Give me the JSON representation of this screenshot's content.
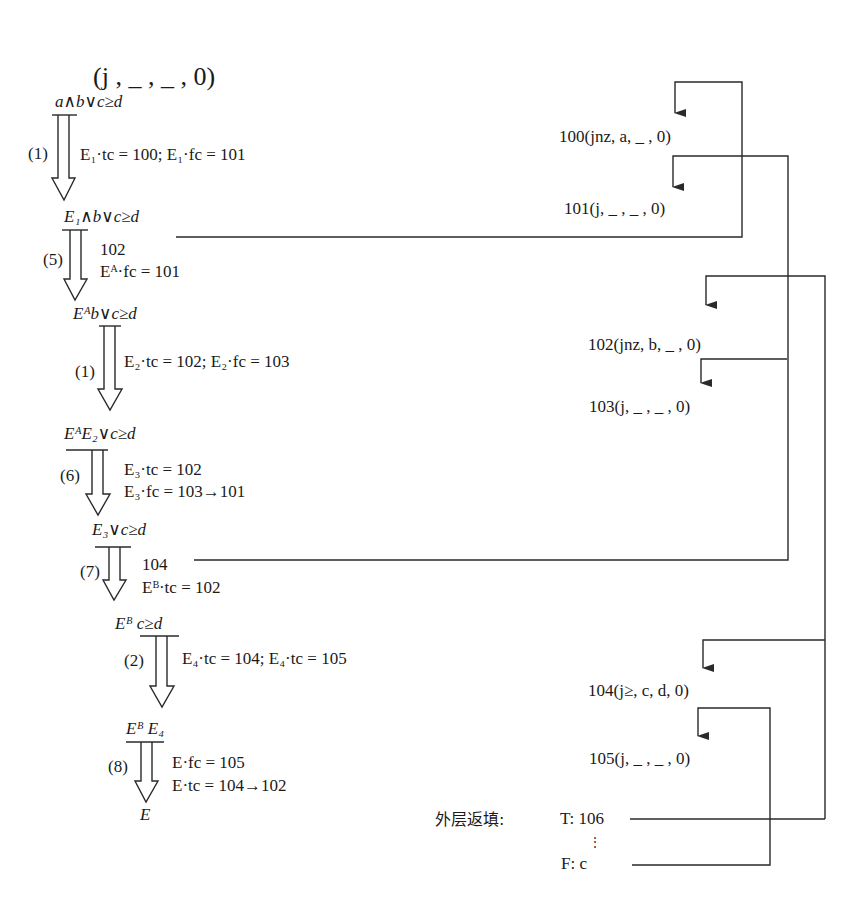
{
  "header": {
    "title": "(j , _ , _ , 0)"
  },
  "derivation": {
    "expressions": [
      "a∧b∨c≥d",
      "E₁∧b∨c≥d",
      "Eᴬb∨c≥d",
      "EᴬE₂∨c≥d",
      "E₃∨c≥d",
      "Eᴮ c≥d",
      "Eᴮ E₄",
      "E"
    ],
    "steps": [
      {
        "rule": "(1)",
        "lines": [
          "E₁·tc = 100; E₁·fc = 101"
        ]
      },
      {
        "rule": "(5)",
        "lines": [
          "102",
          "Eᴬ·fc = 101"
        ]
      },
      {
        "rule": "(1)",
        "lines": [
          "E₂·tc = 102; E₂·fc = 103"
        ]
      },
      {
        "rule": "(6)",
        "lines": [
          "E₃·tc = 102",
          "E₃·fc = 103→101"
        ]
      },
      {
        "rule": "(7)",
        "lines": [
          "104",
          "Eᴮ·tc = 102"
        ]
      },
      {
        "rule": "(2)",
        "lines": [
          "E₄·tc = 104; E₄·tc = 105"
        ]
      },
      {
        "rule": "(8)",
        "lines": [
          "E·fc = 105",
          "E·tc = 104→102"
        ]
      }
    ]
  },
  "quadruples": [
    "100(jnz, a, _ , 0)",
    "101(j, _ , _ , 0)",
    "102(jnz, b, _ , 0)",
    "103(j, _ , _ , 0)",
    "104(j≥, c, d, 0)",
    "105(j, _ , _ , 0)"
  ],
  "backfill": {
    "label": "外层返填:",
    "true_exit": "T: 106",
    "ellipsis": "⋮",
    "false_exit": "F: c"
  },
  "colors": {
    "line": "#2a2a2a",
    "text": "#1a1a1a",
    "background": "#ffffff"
  }
}
